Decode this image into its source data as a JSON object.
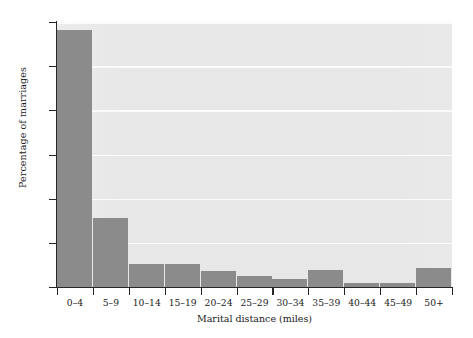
{
  "chart_data": {
    "type": "bar",
    "title": "",
    "xlabel": "Marital distance (miles)",
    "ylabel": "Percentage of marriages",
    "categories": [
      "0–4",
      "5–9",
      "10–14",
      "15–19",
      "20–24",
      "25–29",
      "30–34",
      "35–39",
      "40–44",
      "45–49",
      "50+"
    ],
    "values": [
      58.2,
      15.6,
      5.2,
      5.2,
      3.6,
      2.5,
      1.8,
      3.8,
      1.0,
      0.9,
      4.3
    ],
    "ylim": [
      0,
      60
    ],
    "ytick_labels": [
      "0",
      "10",
      "20",
      "30",
      "40",
      "50",
      "60"
    ],
    "ytick_values": [
      0,
      10,
      20,
      30,
      40,
      50,
      60
    ],
    "grid": true,
    "grid_axis": "y",
    "legend": "none",
    "bar_color": "#8b8b8b",
    "plot_background": "#e7e7e7",
    "gridline_color": "#fbfbfb",
    "axis_color": "#262626",
    "text_color": "#1a1a1a"
  }
}
